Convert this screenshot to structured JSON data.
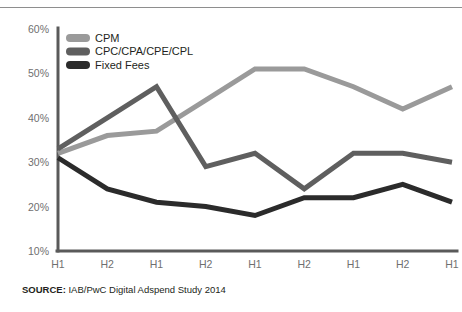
{
  "top_rule": {
    "color": "#8e8e8e"
  },
  "source": {
    "label": "SOURCE:",
    "text": " IAB/PwC Digital Adspend Study 2014"
  },
  "chart_data": {
    "type": "line",
    "title": "",
    "xlabel": "",
    "ylabel": "",
    "ylim": [
      10,
      60
    ],
    "ytick_values": [
      60,
      50,
      40,
      30,
      20,
      10
    ],
    "ytick_labels": [
      "60%",
      "50%",
      "40%",
      "30%",
      "20%",
      "10%"
    ],
    "grid": false,
    "legend_position": "top-left",
    "categories": [
      "H1 2010",
      "H2 2010",
      "H1 2011",
      "H2 2011",
      "H1 2012",
      "H2 2012",
      "H1 2013",
      "H2 2013",
      "H1 2014"
    ],
    "category_lines": [
      [
        "H1",
        "2010"
      ],
      [
        "H2",
        "2010"
      ],
      [
        "H1",
        "2011"
      ],
      [
        "H2",
        "2011"
      ],
      [
        "H1",
        "2012"
      ],
      [
        "H2",
        "2012"
      ],
      [
        "H1",
        "2013"
      ],
      [
        "H2",
        "2013"
      ],
      [
        "H1",
        "2014"
      ]
    ],
    "series": [
      {
        "name": "CPM",
        "color": "#9a9a9a",
        "values": [
          32,
          36,
          37,
          44,
          51,
          51,
          47,
          42,
          47
        ]
      },
      {
        "name": "CPC/CPA/CPE/CPL",
        "color": "#5f5f5f",
        "values": [
          33,
          40,
          47,
          29,
          32,
          24,
          32,
          32,
          30
        ]
      },
      {
        "name": "Fixed Fees",
        "color": "#2b2b2b",
        "values": [
          31,
          24,
          21,
          20,
          18,
          22,
          22,
          25,
          21
        ]
      }
    ],
    "axis_color": "#5a5a5a",
    "tick_color": "#6f6f6f"
  }
}
